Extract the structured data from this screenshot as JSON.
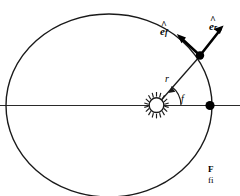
{
  "figure": {
    "kind": "orbit-diagram",
    "background_color": "#ffffff",
    "stroke_color": "#1a1a1a",
    "width": 240,
    "height": 196,
    "labels": {
      "unit_vector_radial": {
        "base": "e",
        "hat": "^",
        "subscript": "r",
        "full": "êr"
      },
      "unit_vector_transverse": {
        "base": "e",
        "hat": "^",
        "subscript": "f",
        "full": "êf"
      },
      "radius": "r",
      "true_anomaly": "f"
    },
    "markers": {
      "sun_symbol": "sun-at-focus",
      "planet_point": "orbiting-body",
      "perihelion_point": "perihelion-marker"
    },
    "caption": {
      "head": "F",
      "body": "fi"
    }
  }
}
